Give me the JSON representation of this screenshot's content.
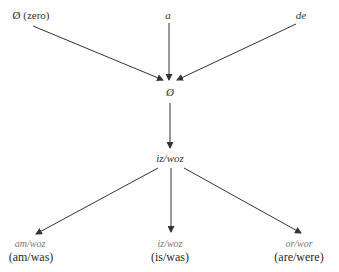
{
  "diagram": {
    "top_nodes": [
      {
        "id": "zero",
        "label": "Ø (zero)",
        "italic": false
      },
      {
        "id": "a",
        "label": "a",
        "italic": true
      },
      {
        "id": "de",
        "label": "de",
        "italic": true
      }
    ],
    "merge_node": {
      "id": "null",
      "label": "Ø"
    },
    "middle_node": {
      "id": "iz_woz",
      "label": "iz/woz"
    },
    "bottom_nodes": [
      {
        "id": "am",
        "form": "am/woz",
        "gloss": "(am/was)"
      },
      {
        "id": "is",
        "form": "iz/woz",
        "gloss": "(is/was)"
      },
      {
        "id": "are",
        "form": "or/wor",
        "gloss": "(are/were)"
      }
    ],
    "edges": [
      {
        "from": "zero",
        "to": "null"
      },
      {
        "from": "a",
        "to": "null"
      },
      {
        "from": "de",
        "to": "null"
      },
      {
        "from": "null",
        "to": "iz_woz"
      },
      {
        "from": "iz_woz",
        "to": "am"
      },
      {
        "from": "iz_woz",
        "to": "is"
      },
      {
        "from": "iz_woz",
        "to": "are"
      }
    ],
    "line_color": "#333333"
  }
}
